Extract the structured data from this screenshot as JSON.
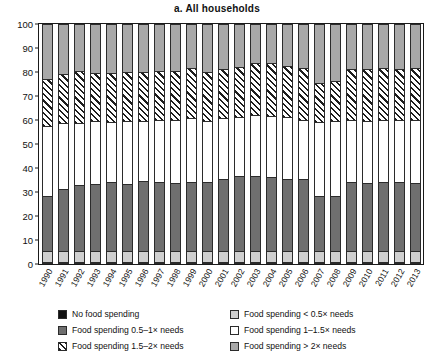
{
  "chart_data": {
    "type": "bar",
    "subtype": "stacked-bar-100-percent",
    "title": "a.  All households",
    "xlabel": "",
    "ylabel": "Percent",
    "ylim": [
      0,
      100
    ],
    "yticks": [
      0,
      10,
      20,
      30,
      40,
      50,
      60,
      70,
      80,
      90,
      100
    ],
    "grid": false,
    "legend_position": "below-plot",
    "categories": [
      "1990",
      "1991",
      "1992",
      "1993",
      "1994",
      "1995",
      "1996",
      "1997",
      "1998",
      "1999",
      "2000",
      "2001",
      "2002",
      "2003",
      "2004",
      "2005",
      "2006",
      "2007",
      "2008",
      "2009",
      "2010",
      "2011",
      "2012",
      "2013"
    ],
    "series": [
      {
        "name": "No food spending",
        "key": "none",
        "color": "#111111",
        "pattern": "solid",
        "values": [
          0.4,
          0.4,
          0.4,
          0.4,
          0.4,
          0.4,
          0.4,
          0.4,
          0.4,
          0.4,
          0.4,
          0.4,
          0.4,
          0.4,
          0.4,
          0.4,
          0.4,
          0.4,
          0.4,
          0.4,
          0.4,
          0.4,
          0.4,
          0.4
        ]
      },
      {
        "name": "Food spending < 0.5× needs",
        "key": "lt05",
        "color": "#cfcfcf",
        "pattern": "solid",
        "values": [
          4.6,
          4.6,
          4.6,
          4.6,
          4.6,
          4.6,
          4.6,
          4.6,
          4.6,
          4.6,
          4.6,
          4.6,
          4.6,
          4.6,
          4.6,
          4.6,
          4.6,
          4.6,
          4.6,
          4.6,
          4.6,
          4.6,
          4.6,
          4.6
        ]
      },
      {
        "name": "Food spending 0.5–1× needs",
        "key": "s05to1",
        "color": "#6f6f6f",
        "pattern": "solid",
        "values": [
          23.0,
          26.0,
          27.5,
          28.0,
          29.0,
          28.0,
          29.5,
          29.0,
          28.5,
          29.0,
          29.0,
          30.0,
          31.5,
          31.5,
          31.0,
          30.0,
          30.0,
          23.0,
          23.0,
          29.0,
          28.5,
          29.0,
          29.0,
          28.5
        ]
      },
      {
        "name": "Food spending 1–1.5× needs",
        "key": "s1to15",
        "color": "#ffffff",
        "pattern": "solid",
        "values": [
          29.5,
          27.5,
          26.0,
          26.5,
          25.0,
          26.5,
          25.0,
          26.0,
          26.5,
          26.5,
          25.5,
          25.5,
          24.5,
          25.5,
          25.5,
          26.0,
          25.0,
          31.0,
          31.5,
          26.0,
          26.0,
          26.0,
          26.0,
          26.5
        ]
      },
      {
        "name": "Food spending 1.5–2× needs",
        "key": "s15to2",
        "color": "#ffffff",
        "pattern": "diagonal-hatch",
        "values": [
          19.5,
          20.5,
          22.0,
          20.0,
          20.5,
          20.5,
          20.5,
          20.5,
          20.5,
          21.0,
          20.5,
          20.5,
          21.0,
          21.5,
          22.0,
          21.5,
          21.5,
          16.5,
          16.5,
          21.0,
          21.5,
          21.5,
          21.0,
          21.5
        ]
      },
      {
        "name": "Food spending > 2× needs",
        "key": "gt2",
        "color": "#a8a8a8",
        "pattern": "solid",
        "values": [
          23.0,
          21.0,
          19.5,
          20.5,
          20.5,
          20.0,
          20.0,
          19.5,
          19.5,
          18.5,
          20.0,
          19.0,
          18.0,
          16.5,
          16.5,
          17.5,
          18.5,
          24.5,
          24.0,
          19.0,
          19.0,
          18.5,
          19.0,
          18.5
        ]
      }
    ],
    "annotations": []
  },
  "legend": {
    "items": [
      {
        "label": "No food spending",
        "swatch": "none",
        "column": 0
      },
      {
        "label": "Food spending 0.5–1× needs",
        "swatch": "s05to1",
        "column": 0
      },
      {
        "label": "Food spending 1.5–2× needs",
        "swatch": "s15to2",
        "column": 0
      },
      {
        "label": "Food spending < 0.5× needs",
        "swatch": "lt05",
        "column": 1
      },
      {
        "label": "Food spending 1–1.5× needs",
        "swatch": "s1to15",
        "column": 1
      },
      {
        "label": "Food spending > 2× needs",
        "swatch": "gt2",
        "column": 1
      }
    ]
  },
  "colors": {
    "no_food_spending": "#111111",
    "lt_half_needs": "#cfcfcf",
    "half_to_1_needs": "#6f6f6f",
    "one_to_1_5_needs": "#ffffff",
    "one_5_to_2_needs": "#ffffff",
    "gt_2_needs": "#a8a8a8",
    "axis": "#1a1a1a",
    "background": "#ffffff"
  }
}
